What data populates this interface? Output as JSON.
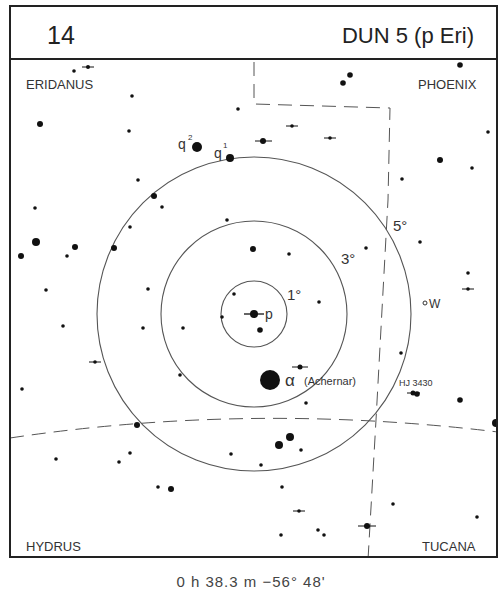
{
  "header": {
    "chart_number": "14",
    "title": "DUN 5 (p Eri)"
  },
  "constellations": {
    "top_left": "ERIDANUS",
    "top_right": "PHOENIX",
    "bottom_left": "HYDRUS",
    "bottom_right": "TUCANA"
  },
  "circles": {
    "r1": "1°",
    "r3": "3°",
    "r5": "5°"
  },
  "labels": {
    "target": "p",
    "alpha_symbol": "α",
    "alpha_name": "(Achernar)",
    "q1": "q",
    "q1_sup": "1",
    "q2": "q",
    "q2_sup": "2",
    "w": "W",
    "hj": "HJ 3430"
  },
  "caption": "0 h 38.3 m   −56° 48'"
}
